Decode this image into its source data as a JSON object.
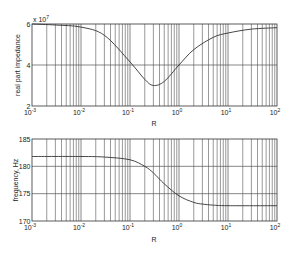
{
  "chart_data": [
    {
      "type": "line",
      "title": "",
      "xlabel": "R",
      "ylabel": "real part impedance",
      "y_multiplier": "x 10^7",
      "xscale": "log",
      "xlim": [
        0.001,
        100
      ],
      "ylim": [
        2,
        6
      ],
      "xticks": [
        "10^-3",
        "10^-2",
        "10^-1",
        "10^0",
        "10^1",
        "10^2"
      ],
      "yticks": [
        "2",
        "4",
        "6"
      ],
      "grid": true,
      "series": [
        {
          "name": "real part impedance",
          "x": [
            0.001,
            0.003,
            0.01,
            0.03,
            0.1,
            0.2,
            0.3,
            0.5,
            1,
            2,
            5,
            10,
            30,
            100
          ],
          "y": [
            6.0,
            5.95,
            5.85,
            5.45,
            4.15,
            3.3,
            3.0,
            3.2,
            4.0,
            4.75,
            5.35,
            5.56,
            5.75,
            5.82
          ]
        }
      ]
    },
    {
      "type": "line",
      "title": "",
      "xlabel": "R",
      "ylabel": "frequency, Hz",
      "xscale": "log",
      "xlim": [
        0.001,
        100
      ],
      "ylim": [
        170,
        185
      ],
      "xticks": [
        "10^-3",
        "10^-2",
        "10^-1",
        "10^0",
        "10^1",
        "10^2"
      ],
      "yticks": [
        "170",
        "175",
        "180",
        "185"
      ],
      "grid": true,
      "series": [
        {
          "name": "frequency",
          "x": [
            0.001,
            0.01,
            0.03,
            0.1,
            0.2,
            0.3,
            0.5,
            1,
            2,
            3,
            5,
            10,
            100
          ],
          "y": [
            181.8,
            181.8,
            181.7,
            181.2,
            180.0,
            178.8,
            176.8,
            174.6,
            173.4,
            173.1,
            172.9,
            172.8,
            172.8
          ]
        }
      ]
    }
  ],
  "plots": {
    "top": {
      "ylabel": "real part impedance",
      "multiplier_base": "x 10",
      "multiplier_exp": "7",
      "xlabel": "R",
      "yticks": [
        "6",
        "4",
        "2"
      ],
      "xtick_base": "10",
      "xtick_exps": [
        "-3",
        "-2",
        "-1",
        "0",
        "1",
        "2"
      ]
    },
    "bottom": {
      "ylabel": "frequency, Hz",
      "xlabel": "R",
      "yticks": [
        "185",
        "180",
        "175",
        "170"
      ],
      "xtick_base": "10",
      "xtick_exps": [
        "-3",
        "-2",
        "-1",
        "0",
        "1",
        "2"
      ]
    }
  },
  "colors": {
    "line": "#333333",
    "grid": "#555555",
    "axis": "#333333",
    "background": "#ffffff"
  }
}
